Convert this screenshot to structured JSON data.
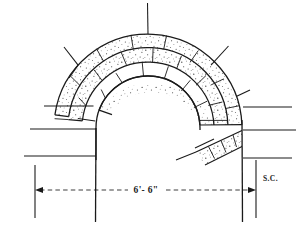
{
  "drawing": {
    "title": "Tunnel arch lining cross-section",
    "background_color": "#ffffff",
    "ink_color": "#1a1a1a"
  },
  "labels": {
    "span_dimension": "6'- 6\"",
    "section_note": "S.C."
  },
  "geometry": {
    "center_x": 148,
    "center_y": 128,
    "inner_radius": 52,
    "ring_radii": [
      52,
      66,
      80,
      94
    ],
    "springing_y": 128,
    "wall_bottom_y": 222,
    "left_wall_x": 96,
    "right_wall_x": 242
  },
  "rings": [
    {
      "name": "inner-lining-ring",
      "inner_r": 52,
      "outer_r": 66,
      "stipple": "light"
    },
    {
      "name": "middle-lining-ring",
      "inner_r": 66,
      "outer_r": 80,
      "stipple": "medium"
    },
    {
      "name": "outer-lining-ring",
      "inner_r": 80,
      "outer_r": 94,
      "stipple": "medium"
    }
  ],
  "ring_extents_deg": {
    "inner": {
      "start": 200,
      "end": 358
    },
    "middle": {
      "start": 186,
      "end": 358
    },
    "outer": {
      "start": 172,
      "end": 358
    }
  },
  "joint_angles_deg": {
    "inner": [
      215,
      240,
      265,
      288,
      310,
      332,
      352
    ],
    "middle": [
      200,
      226,
      250,
      272,
      295,
      318,
      340,
      356
    ],
    "outer": [
      186,
      212,
      236,
      258,
      280,
      302,
      324,
      346
    ]
  },
  "spokes": [
    {
      "name": "crown-spoke",
      "angle_deg": 270,
      "length": 38
    },
    {
      "name": "upper-left-spoke",
      "angle_deg": 222,
      "length": 26
    },
    {
      "name": "upper-right-spoke",
      "angle_deg": 312,
      "length": 30
    },
    {
      "name": "left-haunch-spoke",
      "angle_deg": 196,
      "length": 22
    },
    {
      "name": "right-haunch-spoke",
      "angle_deg": 340,
      "length": 24
    }
  ],
  "left_ticks": [
    {
      "y": 106,
      "x_start": 93,
      "x_end": 44
    },
    {
      "y": 129,
      "x_start": 96,
      "x_end": 30
    },
    {
      "y": 156,
      "x_start": 96,
      "x_end": 24
    }
  ],
  "right_ticks": [
    {
      "y": 107,
      "x_start": 244,
      "x_end": 292
    },
    {
      "y": 130,
      "x_start": 244,
      "x_end": 296
    },
    {
      "y": 158,
      "x_start": 244,
      "x_end": 292
    }
  ],
  "dimension": {
    "y": 190,
    "x_left": 35,
    "x_right": 256,
    "text_x": 146,
    "text_y": 192,
    "ext_left_x": 35,
    "ext_right_x": 256,
    "ext_top_y": 158,
    "ext_bottom_y": 222
  },
  "section_note_pos": {
    "x": 263,
    "y": 180
  }
}
